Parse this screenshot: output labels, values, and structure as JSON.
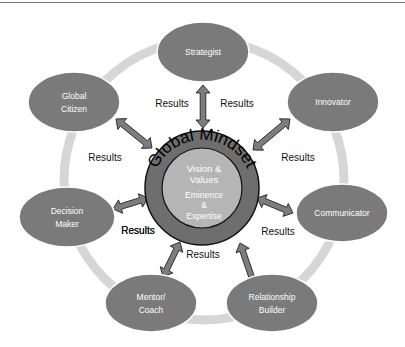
{
  "diagram": {
    "center": {
      "ring_label": "Global Mindset",
      "inner_lines": [
        "Vision &",
        "Values"
      ],
      "inner_lines_2": [
        "Eminence",
        "&",
        "Expertise"
      ]
    },
    "nodes": [
      {
        "id": "strategist",
        "lines": [
          "Strategist"
        ]
      },
      {
        "id": "innovator",
        "lines": [
          "Innovator"
        ]
      },
      {
        "id": "communicator",
        "lines": [
          "Communicator"
        ]
      },
      {
        "id": "relationship-builder",
        "lines": [
          "Relationship",
          "Builder"
        ]
      },
      {
        "id": "mentor-coach",
        "lines": [
          "Mentor/",
          "Coach"
        ]
      },
      {
        "id": "decision-maker",
        "lines": [
          "Decision",
          "Maker"
        ]
      },
      {
        "id": "global-citizen",
        "lines": [
          "Global",
          "Citizen"
        ]
      }
    ],
    "result_labels": [
      "Results",
      "Results",
      "Results",
      "Results",
      "Results",
      "Results",
      "Results",
      "Results"
    ],
    "colors": {
      "node_fill": "#7a7a7a",
      "outer_ring": "#d6d6d6",
      "core_ring": "#6e6e6e",
      "core_inner": "#b5b5b5",
      "arrow_fill": "#7d7d7d"
    }
  }
}
